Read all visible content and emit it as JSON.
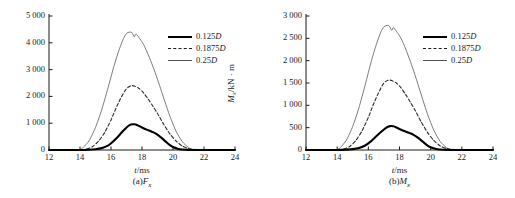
{
  "figure": {
    "panels": [
      {
        "id": "a",
        "caption_prefix": "(a)",
        "caption_symbol": "F",
        "caption_subscript": "x",
        "ylabel_main": "F",
        "ylabel_sub": "x",
        "ylabel_unit": "/kN",
        "xlabel_main": "t",
        "xlabel_unit": "/ms",
        "xticks": [
          "12",
          "14",
          "16",
          "18",
          "20",
          "22",
          "24"
        ],
        "yticks": [
          "0",
          "1 000",
          "2 000",
          "3 000",
          "4 000",
          "5 000"
        ],
        "legend": [
          {
            "label_num": "0.125",
            "label_sym": "D",
            "style": "thick"
          },
          {
            "label_num": "0.1875",
            "label_sym": "D",
            "style": "dashed"
          },
          {
            "label_num": "0.25",
            "label_sym": "D",
            "style": "thin"
          }
        ]
      },
      {
        "id": "b",
        "caption_prefix": "(b)",
        "caption_symbol": "M",
        "caption_subscript": "x",
        "ylabel_main": "M",
        "ylabel_sub": "x",
        "ylabel_unit": "/kN · m",
        "xlabel_main": "t",
        "xlabel_unit": "/ms",
        "xticks": [
          "12",
          "14",
          "16",
          "18",
          "20",
          "22",
          "24"
        ],
        "yticks": [
          "0",
          "500",
          "1 000",
          "1 500",
          "2 000",
          "2 500",
          "3 000"
        ],
        "legend": [
          {
            "label_num": "0.125",
            "label_sym": "D",
            "style": "thick"
          },
          {
            "label_num": "0.1875",
            "label_sym": "D",
            "style": "dashed"
          },
          {
            "label_num": "0.25",
            "label_sym": "D",
            "style": "thin"
          }
        ]
      }
    ]
  },
  "chart_data": [
    {
      "type": "line",
      "panel": "a",
      "title": "(a)Fx",
      "xlabel": "t/ms",
      "ylabel": "Fx/kN",
      "xlim": [
        12,
        24
      ],
      "ylim": [
        0,
        5000
      ],
      "xticks": [
        12,
        14,
        16,
        18,
        20,
        22,
        24
      ],
      "yticks": [
        0,
        1000,
        2000,
        3000,
        4000,
        5000
      ],
      "grid": false,
      "legend_position": "right",
      "series": [
        {
          "name": "0.125D",
          "style": "solid-thick",
          "x": [
            12.0,
            13.0,
            14.0,
            14.5,
            15.0,
            15.4,
            15.8,
            16.1,
            16.4,
            16.7,
            17.0,
            17.2,
            17.4,
            17.6,
            17.8,
            18.0,
            18.3,
            18.6,
            18.9,
            19.2,
            19.5,
            19.8,
            20.0,
            20.3,
            20.6,
            21.0,
            22.0,
            24.0
          ],
          "y": [
            0,
            0,
            0,
            10,
            30,
            70,
            160,
            300,
            470,
            660,
            840,
            930,
            960,
            950,
            900,
            840,
            760,
            690,
            610,
            480,
            330,
            180,
            110,
            50,
            20,
            5,
            0,
            0
          ]
        },
        {
          "name": "0.1875D",
          "style": "dashed",
          "x": [
            12.0,
            13.0,
            14.0,
            14.4,
            14.8,
            15.2,
            15.6,
            16.0,
            16.3,
            16.6,
            16.9,
            17.1,
            17.3,
            17.5,
            17.8,
            18.1,
            18.4,
            18.7,
            19.0,
            19.4,
            19.8,
            20.2,
            20.6,
            21.0,
            21.4,
            22.0,
            24.0
          ],
          "y": [
            0,
            0,
            0,
            30,
            120,
            330,
            660,
            1120,
            1530,
            1900,
            2210,
            2340,
            2400,
            2390,
            2300,
            2130,
            1900,
            1640,
            1360,
            960,
            600,
            330,
            150,
            50,
            10,
            0,
            0
          ]
        },
        {
          "name": "0.25D",
          "style": "solid-thin",
          "x": [
            12.0,
            13.0,
            13.9,
            14.2,
            14.6,
            15.0,
            15.4,
            15.8,
            16.2,
            16.5,
            16.8,
            17.0,
            17.2,
            17.35,
            17.5,
            17.6,
            17.8,
            18.1,
            18.4,
            18.7,
            19.0,
            19.4,
            19.8,
            20.2,
            20.6,
            21.0,
            21.3,
            22.0,
            24.0
          ],
          "y": [
            0,
            0,
            0,
            90,
            360,
            840,
            1500,
            2300,
            3150,
            3700,
            4150,
            4350,
            4400,
            4380,
            4220,
            4330,
            4200,
            3940,
            3560,
            3120,
            2640,
            1940,
            1260,
            700,
            310,
            90,
            10,
            0,
            0
          ]
        }
      ]
    },
    {
      "type": "line",
      "panel": "b",
      "title": "(b)Mx",
      "xlabel": "t/ms",
      "ylabel": "Mx/kN · m",
      "xlim": [
        12,
        24
      ],
      "ylim": [
        0,
        3000
      ],
      "xticks": [
        12,
        14,
        16,
        18,
        20,
        22,
        24
      ],
      "yticks": [
        0,
        500,
        1000,
        1500,
        2000,
        2500,
        3000
      ],
      "grid": false,
      "legend_position": "right",
      "series": [
        {
          "name": "0.125D",
          "style": "solid-thick",
          "x": [
            12.0,
            13.0,
            14.0,
            14.6,
            15.0,
            15.4,
            15.8,
            16.1,
            16.4,
            16.7,
            17.0,
            17.2,
            17.4,
            17.6,
            17.8,
            18.0,
            18.3,
            18.6,
            18.9,
            19.2,
            19.5,
            19.8,
            20.0,
            20.3,
            20.6,
            21.0,
            22.0,
            24.0
          ],
          "y": [
            0,
            0,
            0,
            8,
            20,
            45,
            100,
            175,
            270,
            370,
            460,
            510,
            535,
            530,
            505,
            470,
            425,
            385,
            340,
            270,
            185,
            100,
            60,
            28,
            10,
            2,
            0,
            0
          ]
        },
        {
          "name": "0.1875D",
          "style": "dashed",
          "x": [
            12.0,
            13.0,
            14.0,
            14.4,
            14.8,
            15.2,
            15.6,
            16.0,
            16.3,
            16.6,
            16.9,
            17.1,
            17.3,
            17.5,
            17.8,
            18.1,
            18.4,
            18.7,
            19.0,
            19.4,
            19.8,
            20.2,
            20.6,
            21.0,
            21.4,
            22.0,
            24.0
          ],
          "y": [
            0,
            0,
            0,
            20,
            80,
            215,
            430,
            730,
            1000,
            1240,
            1450,
            1530,
            1565,
            1555,
            1500,
            1390,
            1240,
            1070,
            890,
            625,
            390,
            215,
            95,
            32,
            6,
            0,
            0
          ]
        },
        {
          "name": "0.25D",
          "style": "solid-thin",
          "x": [
            12.0,
            13.0,
            13.9,
            14.2,
            14.6,
            15.0,
            15.4,
            15.8,
            16.2,
            16.5,
            16.8,
            17.0,
            17.2,
            17.35,
            17.5,
            17.6,
            17.8,
            18.1,
            18.4,
            18.7,
            19.0,
            19.4,
            19.8,
            20.2,
            20.6,
            21.0,
            21.3,
            22.0,
            24.0
          ],
          "y": [
            0,
            0,
            0,
            55,
            225,
            530,
            950,
            1460,
            2000,
            2350,
            2640,
            2760,
            2790,
            2775,
            2680,
            2740,
            2660,
            2500,
            2260,
            1980,
            1675,
            1230,
            800,
            445,
            195,
            58,
            6,
            0,
            0
          ]
        }
      ]
    }
  ]
}
